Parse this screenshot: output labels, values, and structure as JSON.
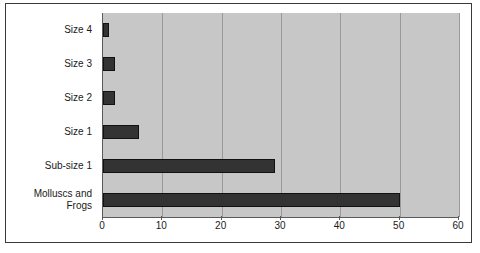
{
  "chart_data": {
    "type": "bar",
    "orientation": "horizontal",
    "title": "",
    "subtitle": "",
    "xlabel": "",
    "ylabel": "",
    "categories": [
      "Molluscs and\nFrogs",
      "Sub-size 1",
      "Size 1",
      "Size 2",
      "Size 3",
      "Size 4"
    ],
    "values": [
      50,
      29,
      6,
      2,
      2,
      1
    ],
    "series": [
      {
        "name": "",
        "values": [
          50,
          29,
          6,
          2,
          2,
          1
        ]
      }
    ],
    "xlim": [
      0,
      60
    ],
    "xticks": [
      0,
      10,
      20,
      30,
      40,
      50,
      60
    ],
    "xtick_labels": [
      "0",
      "10",
      "20",
      "30",
      "40",
      "50",
      "60"
    ],
    "grid": true,
    "grid_axis": "x",
    "legend": false,
    "legend_position": "none",
    "bar_color": "#333333",
    "plot_background": "#c7c7c7",
    "page_background": "#ffffff",
    "gridline_color": "#9a9a9a",
    "axis_color": "#5a5a5a",
    "border_color": "#3a3a3a",
    "text_color": "#1a1a1a"
  },
  "axes": {
    "category_axis": {
      "name": "category-axis",
      "labels_top_to_bottom": [
        "Size 4",
        "Size 3",
        "Size 2",
        "Size 1",
        "Sub-size 1",
        "Molluscs and\nFrogs"
      ]
    },
    "value_axis": {
      "name": "value-axis",
      "ticks": [
        {
          "value": 0,
          "label": "0"
        },
        {
          "value": 10,
          "label": "10"
        },
        {
          "value": 20,
          "label": "20"
        },
        {
          "value": 30,
          "label": "30"
        },
        {
          "value": 40,
          "label": "40"
        },
        {
          "value": 50,
          "label": "50"
        },
        {
          "value": 60,
          "label": "60"
        }
      ]
    }
  },
  "bars_top_to_bottom": [
    {
      "category": "Size 4",
      "value": 1
    },
    {
      "category": "Size 3",
      "value": 2
    },
    {
      "category": "Size 2",
      "value": 2
    },
    {
      "category": "Size 1",
      "value": 6
    },
    {
      "category": "Sub-size 1",
      "value": 29
    },
    {
      "category": "Molluscs and Frogs",
      "value": 50
    }
  ]
}
